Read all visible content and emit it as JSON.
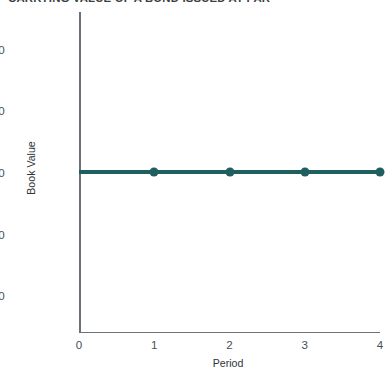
{
  "chart_data": {
    "type": "line",
    "title": "CARRYING VALUE OF A BOND ISSUED AT PAR",
    "xlabel": "Period",
    "ylabel": "Book Value",
    "x": [
      0,
      1,
      2,
      3,
      4
    ],
    "xticklabels": [
      "0",
      "1",
      "2",
      "3",
      "4"
    ],
    "xlim": [
      0,
      4
    ],
    "yticks": [
      960,
      980,
      1000,
      1020,
      1040
    ],
    "yticklabels": [
      "960",
      "980",
      "1,000",
      "1,020",
      "1,040"
    ],
    "ylim": [
      948,
      1052
    ],
    "grid": false,
    "legend": null,
    "series": [
      {
        "name": "Carrying Value",
        "values": [
          1000,
          1000,
          1000,
          1000,
          1000
        ],
        "color": "#1f5f5f",
        "marker": "circle",
        "marker_at_x": [
          1,
          2,
          3,
          4
        ]
      }
    ],
    "colors": {
      "series_line": "#1f5f5f",
      "axis": "#6c7179",
      "tick_text": "#4a4f56",
      "title_text": "#3a3f45",
      "background": "#ffffff"
    }
  }
}
